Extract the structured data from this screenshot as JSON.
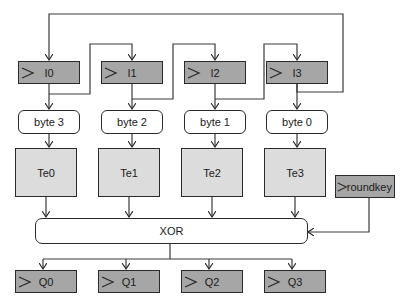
{
  "diagram": {
    "type": "AES round datapath",
    "input_registers": [
      {
        "label": "I0"
      },
      {
        "label": "I1"
      },
      {
        "label": "I2"
      },
      {
        "label": "I3"
      }
    ],
    "byte_selectors": [
      {
        "label": "byte 3"
      },
      {
        "label": "byte 2"
      },
      {
        "label": "byte 1"
      },
      {
        "label": "byte 0"
      }
    ],
    "tables": [
      {
        "label": "Te0"
      },
      {
        "label": "Te1"
      },
      {
        "label": "Te2"
      },
      {
        "label": "Te3"
      }
    ],
    "roundkey": {
      "label": "roundkey"
    },
    "xor": {
      "label": "XOR"
    },
    "output_registers": [
      {
        "label": "Q0"
      },
      {
        "label": "Q1"
      },
      {
        "label": "Q2"
      },
      {
        "label": "Q3"
      }
    ],
    "colors": {
      "register_fill": "#a6a6a6",
      "table_fill": "#dcdcdc",
      "stroke": "#2a2a2a"
    }
  }
}
